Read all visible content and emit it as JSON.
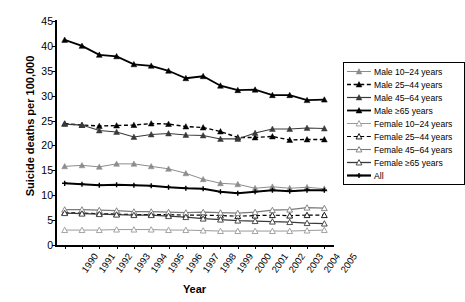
{
  "chart_data": {
    "type": "line",
    "title": "",
    "xlabel": "Year",
    "ylabel": "Suicide deaths per 100,000",
    "ylim": [
      0,
      45
    ],
    "yticks": [
      0,
      5,
      10,
      15,
      20,
      25,
      30,
      35,
      40,
      45
    ],
    "grid": false,
    "legend_position": "right",
    "categories": [
      1990,
      1991,
      1992,
      1993,
      1994,
      1995,
      1996,
      1997,
      1998,
      1999,
      2000,
      2001,
      2002,
      2003,
      2004,
      2005
    ],
    "x": [
      "1990",
      "1991",
      "1992",
      "1993",
      "1994",
      "1995",
      "1996",
      "1997",
      "1998",
      "1999",
      "2000",
      "2001",
      "2002",
      "2003",
      "2004",
      "2005"
    ],
    "series": [
      {
        "name": "Male 10–24 years",
        "marker": "triangle-filled",
        "line": "solid",
        "color": "#8c8c8c",
        "width": 1,
        "values": [
          15.8,
          16.0,
          15.7,
          16.3,
          16.3,
          15.8,
          15.3,
          14.4,
          13.2,
          12.4,
          12.2,
          11.4,
          11.7,
          11.4,
          11.6,
          11.3
        ]
      },
      {
        "name": "Male 25–44 years",
        "marker": "triangle-filled",
        "line": "dashed",
        "color": "#000000",
        "width": 1.4,
        "values": [
          24.4,
          24.1,
          23.9,
          24.0,
          24.1,
          24.4,
          24.3,
          23.8,
          23.6,
          22.8,
          21.6,
          21.6,
          21.8,
          21.1,
          21.2,
          21.2
        ]
      },
      {
        "name": "Male 45–64 years",
        "marker": "triangle-filled",
        "line": "solid",
        "color": "#3a3a3a",
        "width": 1.2,
        "values": [
          24.3,
          24.1,
          23.0,
          22.7,
          21.7,
          22.2,
          22.4,
          22.1,
          22.0,
          21.3,
          21.3,
          22.5,
          23.3,
          23.3,
          23.5,
          23.4
        ]
      },
      {
        "name": "Male ≥65 years",
        "marker": "triangle-filled",
        "line": "solid",
        "color": "#000000",
        "width": 1.8,
        "values": [
          41.2,
          40.0,
          38.2,
          37.9,
          36.3,
          36.0,
          35.0,
          33.5,
          33.9,
          32.0,
          31.1,
          31.2,
          30.1,
          30.1,
          29.1,
          29.2
        ]
      },
      {
        "name": "Female 10–24 years",
        "marker": "triangle-open",
        "line": "solid",
        "color": "#9a9a9a",
        "width": 1,
        "values": [
          3.0,
          3.0,
          3.0,
          3.1,
          3.1,
          3.1,
          3.0,
          3.0,
          2.9,
          2.8,
          2.8,
          2.8,
          2.8,
          2.8,
          2.9,
          3.0
        ]
      },
      {
        "name": "Female 25–44 years",
        "marker": "triangle-open",
        "line": "dashed",
        "color": "#000000",
        "width": 1.2,
        "values": [
          6.5,
          6.4,
          6.3,
          6.2,
          6.1,
          6.1,
          6.1,
          6.0,
          6.0,
          5.9,
          5.8,
          5.9,
          6.0,
          5.9,
          6.0,
          6.0
        ]
      },
      {
        "name": "Female 45–64 years",
        "marker": "triangle-open",
        "line": "solid",
        "color": "#7a7a7a",
        "width": 1.1,
        "values": [
          7.1,
          7.1,
          7.0,
          6.9,
          6.7,
          6.7,
          6.6,
          6.5,
          6.6,
          6.5,
          6.4,
          6.6,
          7.0,
          7.1,
          7.5,
          7.4
        ]
      },
      {
        "name": "Female ≥65 years",
        "marker": "triangle-open",
        "line": "solid",
        "color": "#3a3a3a",
        "width": 1.3,
        "values": [
          6.4,
          6.3,
          6.2,
          6.1,
          6.0,
          6.0,
          5.8,
          5.6,
          5.3,
          5.1,
          4.9,
          4.8,
          4.7,
          4.6,
          4.4,
          4.3
        ]
      },
      {
        "name": "All",
        "marker": "plus",
        "line": "solid",
        "color": "#000000",
        "width": 2.2,
        "values": [
          12.4,
          12.2,
          12.0,
          12.1,
          12.0,
          11.9,
          11.6,
          11.4,
          11.3,
          10.7,
          10.4,
          10.7,
          11.0,
          10.8,
          11.0,
          11.0
        ]
      }
    ]
  },
  "legend": {
    "items": [
      {
        "label": "Male 10–24 years"
      },
      {
        "label": "Male 25–44 years"
      },
      {
        "label": "Male 45–64 years"
      },
      {
        "label": "Male ≥65 years"
      },
      {
        "label": "Female 10–24 years"
      },
      {
        "label": "Female 25–44 years"
      },
      {
        "label": "Female 45–64 years"
      },
      {
        "label": "Female ≥65 years"
      },
      {
        "label": "All"
      }
    ]
  }
}
